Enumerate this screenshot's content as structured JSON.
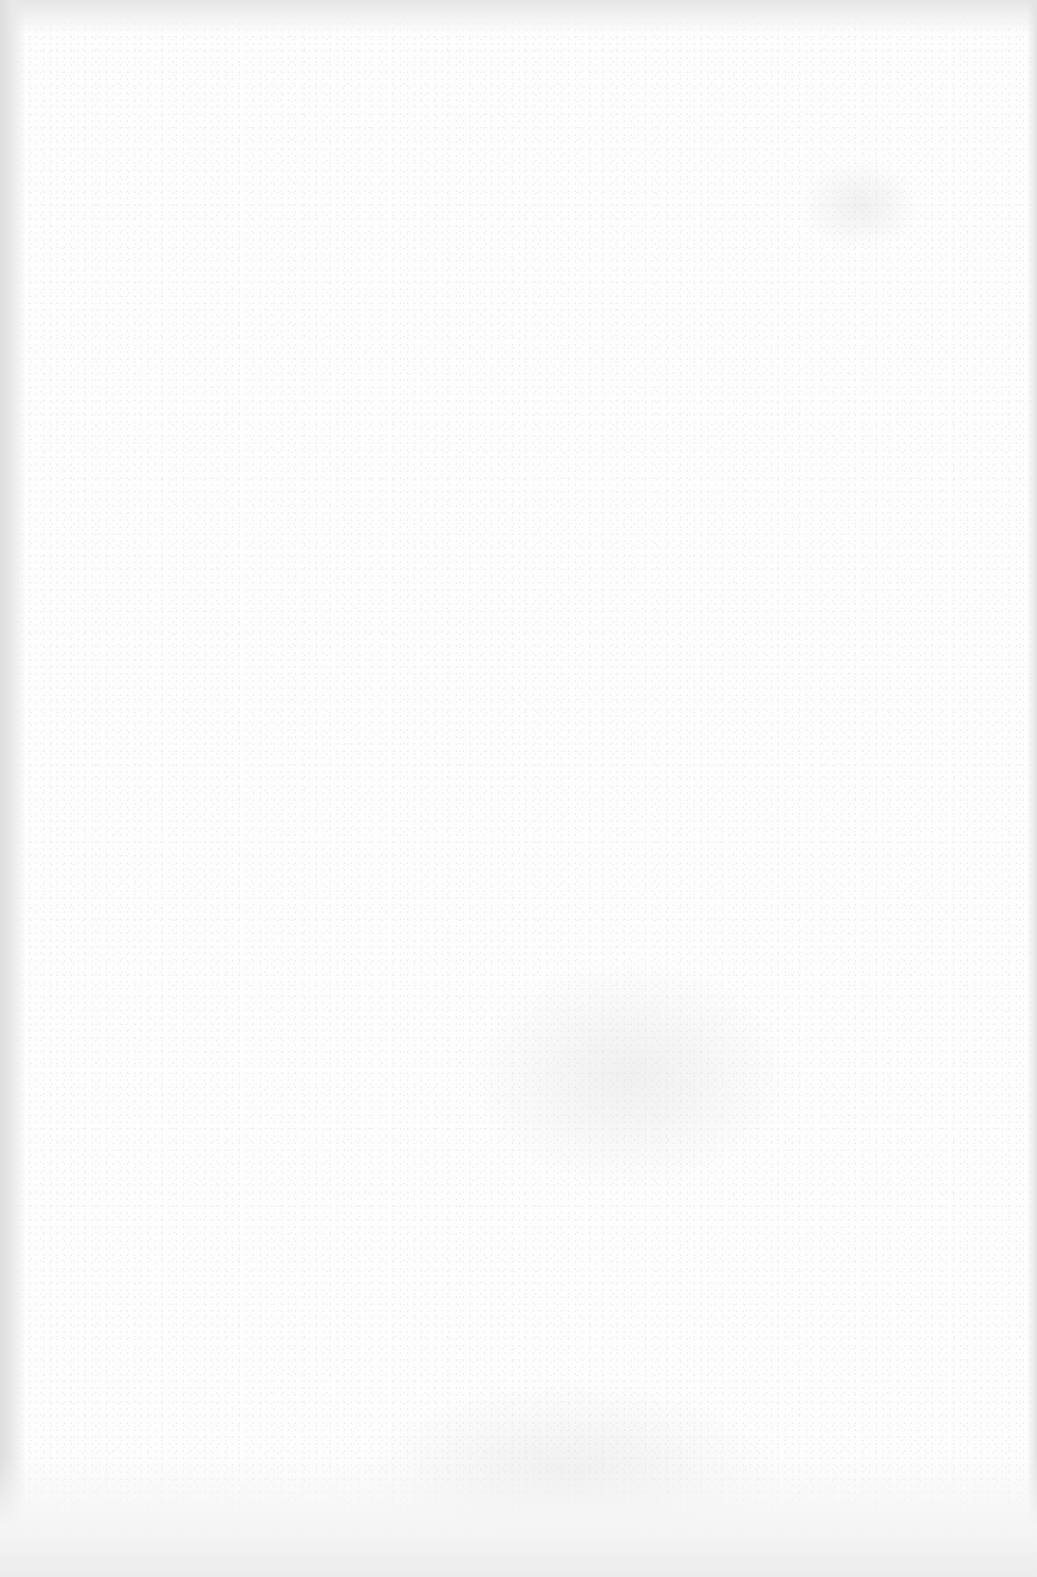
{
  "page": {
    "type": "blank-scanned-page",
    "text_content": [],
    "colors": {
      "paper": "#fdfdfd",
      "edge_shadow": "#dcdcdc"
    }
  }
}
